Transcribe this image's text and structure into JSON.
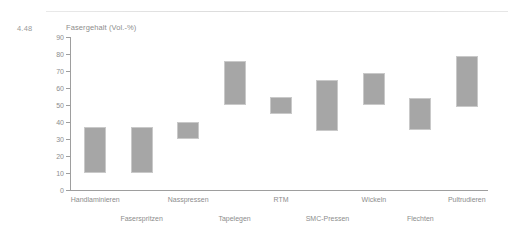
{
  "figure": {
    "number": "4.48",
    "top_rule": true
  },
  "chart_data": {
    "type": "bar",
    "bar_style": "floating-range",
    "title": "Fasergehalt (Vol.-%)",
    "xlabel": "",
    "ylabel": "Fasergehalt (Vol.-%)",
    "ylim": [
      0,
      90
    ],
    "ytick_step": 10,
    "yticks": [
      0,
      10,
      20,
      30,
      40,
      50,
      60,
      70,
      80,
      90
    ],
    "ytick_labels": [
      "0",
      "10",
      "20",
      "30",
      "40",
      "50",
      "60",
      "70",
      "80",
      "90"
    ],
    "grid": false,
    "legend": null,
    "categories": [
      "Handlaminieren",
      "Faserspritzen",
      "Nasspressen",
      "Tapelegen",
      "RTM",
      "SMC-Pressen",
      "Wickeln",
      "Flechten",
      "Pultrudieren"
    ],
    "label_rows": [
      1,
      2,
      1,
      2,
      1,
      2,
      1,
      2,
      1
    ],
    "low_values": [
      10,
      10,
      30,
      50,
      45,
      35,
      50,
      35,
      49
    ],
    "high_values": [
      37,
      37,
      40,
      76,
      55,
      65,
      69,
      54,
      79
    ],
    "bar_color": "#a6a6a6",
    "bar_border_color": "#c9c9c9",
    "axis_color": "#9e9e9e",
    "text_color": "#8d8d8d"
  }
}
